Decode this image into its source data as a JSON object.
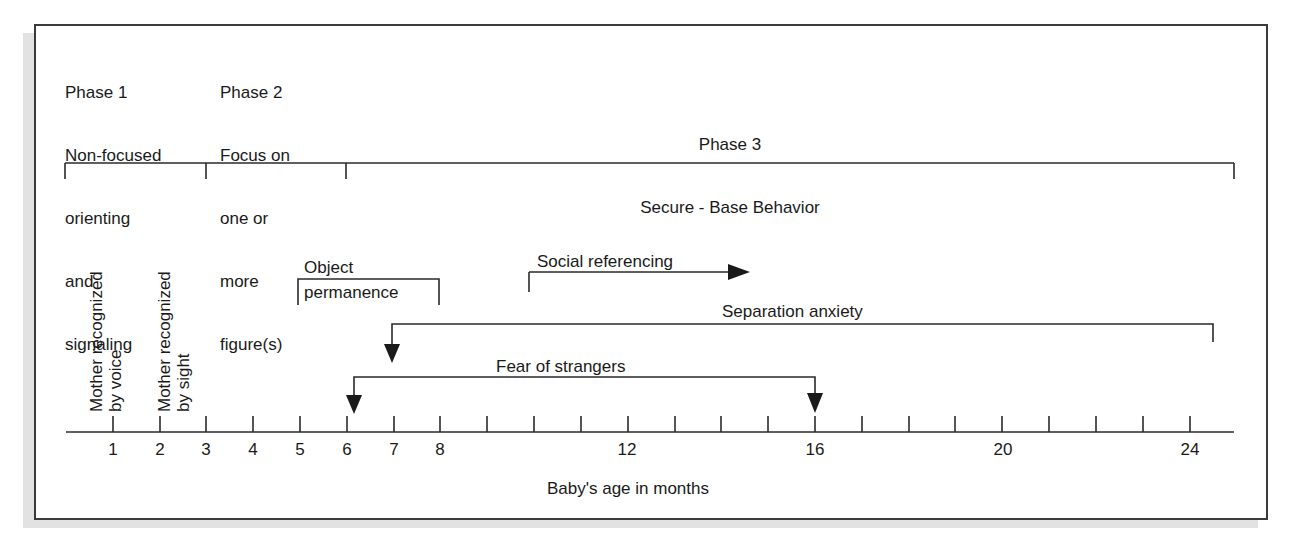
{
  "phases": [
    {
      "title": "Phase 1",
      "lines": [
        "Non-focused",
        "orienting",
        "and",
        "signaling"
      ],
      "start_month": 0,
      "end_month": 3
    },
    {
      "title": "Phase 2",
      "lines": [
        "Focus on",
        "one or",
        "more",
        "figure(s)"
      ],
      "start_month": 3,
      "end_month": 6
    },
    {
      "title": "Phase 3",
      "lines": [
        "Secure - Base Behavior"
      ],
      "start_month": 6,
      "end_month": 25
    }
  ],
  "milestones": {
    "voice": {
      "line1": "Mother recognized",
      "line2": "by voice",
      "month": 1
    },
    "sight": {
      "line1": "Mother recognized",
      "line2": "by sight",
      "month": 2
    }
  },
  "events": {
    "object_permanence": {
      "line1": "Object",
      "line2": "permanence",
      "start_month": 5,
      "end_month": 8
    },
    "social_referencing": {
      "label": "Social referencing",
      "start_month": 10,
      "end_month": 14.5
    },
    "separation_anxiety": {
      "label": "Separation anxiety",
      "start_month": 7,
      "end_month": 24.5
    },
    "fear_of_strangers": {
      "label": "Fear of strangers",
      "start_month": 6,
      "end_month": 16
    }
  },
  "axis": {
    "label": "Baby's age in months",
    "tick_labels": {
      "1": "1",
      "2": "2",
      "3": "3",
      "4": "4",
      "5": "5",
      "6": "6",
      "7": "7",
      "8": "8",
      "12": "12",
      "16": "16",
      "20": "20",
      "24": "24"
    },
    "min": 0,
    "max": 25
  },
  "colors": {
    "line": "#2a2a2a",
    "text": "#1a1a1a",
    "shadow": "#e2e2e2"
  }
}
